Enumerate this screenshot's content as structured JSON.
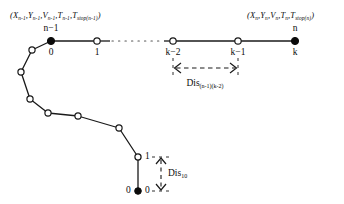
{
  "figure": {
    "type": "trajectory-node-diagram",
    "width": 344,
    "height": 204,
    "stroke_color": "#1a1a1a",
    "background_color": "#ffffff"
  },
  "annotations": {
    "tuple_left": {
      "prefix": "(",
      "x": "X",
      "x_sub": "n-1",
      "y": "Y",
      "y_sub": "n-1",
      "v": "V",
      "v_sub": "n-1",
      "t": "T",
      "t_sub": "n-1",
      "tstop": "T",
      "tstop_sub": "stop(n-1)",
      "suffix": ")",
      "full": "(Xn-1,Yn-1,Vn-1,Tn-1,Tstop(n-1))"
    },
    "tuple_right": {
      "prefix": "(",
      "x": "X",
      "x_sub": "n",
      "y": "Y",
      "y_sub": "n",
      "v": "V",
      "v_sub": "n",
      "t": "T",
      "t_sub": "n",
      "tstop": "T",
      "tstop_sub": "stop(n)",
      "suffix": ")",
      "full": "(Xn,Yn,Vn,Tn,Tstop(n))"
    },
    "dis_upper": {
      "text": "Dis",
      "subscript": "(n-1)(k-2)"
    },
    "dis_lower": {
      "text": "Dis",
      "subscript": "10"
    }
  },
  "top_row_nodes": [
    {
      "id": "node-n-minus-1",
      "top_label": "n−1",
      "bottom_label": "0",
      "filled": true,
      "cx": 51,
      "cy": 41
    },
    {
      "id": "node-1",
      "top_label": "",
      "bottom_label": "1",
      "filled": false,
      "cx": 97,
      "cy": 41
    },
    {
      "id": "node-k-minus-2",
      "top_label": "",
      "bottom_label": "k−2",
      "filled": false,
      "cx": 173,
      "cy": 41
    },
    {
      "id": "node-k-minus-1",
      "top_label": "",
      "bottom_label": "k−1",
      "filled": false,
      "cx": 238,
      "cy": 41
    },
    {
      "id": "node-n",
      "top_label": "n",
      "bottom_label": "k",
      "filled": true,
      "cx": 295,
      "cy": 41
    }
  ],
  "curve_nodes": [
    {
      "id": "curve-node-0",
      "cx": 51,
      "cy": 41,
      "filled": true
    },
    {
      "id": "curve-node-1",
      "cx": 32,
      "cy": 50,
      "filled": false
    },
    {
      "id": "curve-node-2",
      "cx": 21,
      "cy": 72,
      "filled": false
    },
    {
      "id": "curve-node-3",
      "cx": 30,
      "cy": 99,
      "filled": false
    },
    {
      "id": "curve-node-4",
      "cx": 48,
      "cy": 113,
      "filled": false
    },
    {
      "id": "curve-node-5",
      "cx": 78,
      "cy": 116,
      "filled": false
    },
    {
      "id": "curve-node-6",
      "cx": 119,
      "cy": 128,
      "filled": false
    },
    {
      "id": "curve-node-7",
      "cx": 138,
      "cy": 157,
      "filled": false
    },
    {
      "id": "curve-node-8",
      "cx": 138,
      "cy": 191,
      "filled": true
    }
  ],
  "bottom_nodes": {
    "upper": {
      "label_right": "1",
      "cx": 138,
      "cy": 157,
      "filled": false
    },
    "lower": {
      "label_left": "0",
      "label_right": "0",
      "cx": 138,
      "cy": 191,
      "filled": true
    }
  },
  "measure_upper": {
    "from_x": 173,
    "to_x": 238,
    "y": 68,
    "style": "dashed-double-arrow-horizontal"
  },
  "measure_lower": {
    "x": 161,
    "from_y": 157,
    "to_y": 191,
    "style": "dashed-double-arrow-vertical"
  },
  "dotted_gap": {
    "from_x": 110,
    "to_x": 164,
    "y": 41
  }
}
